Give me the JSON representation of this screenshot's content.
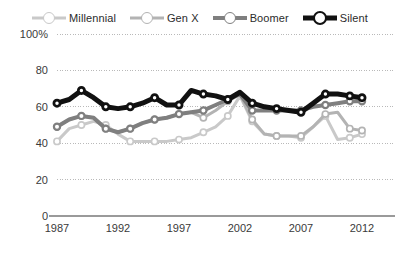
{
  "legend": {
    "position": "top-center",
    "items": [
      {
        "label": "Millennial",
        "color": "#c9c9c9",
        "line_width": 3,
        "marker": "open-circle",
        "marker_size": 5
      },
      {
        "label": "Gen X",
        "color": "#b3b3b3",
        "line_width": 3,
        "marker": "open-circle",
        "marker_size": 5
      },
      {
        "label": "Boomer",
        "color": "#7f7f7f",
        "line_width": 4,
        "marker": "open-circle",
        "marker_size": 5
      },
      {
        "label": "Silent",
        "color": "#111111",
        "line_width": 5,
        "marker": "open-circle",
        "marker_size": 5
      }
    ]
  },
  "axes": {
    "y_ticks": [
      "0",
      "20",
      "40",
      "60",
      "80",
      "100%"
    ],
    "y_values": [
      0,
      20,
      40,
      60,
      80,
      100
    ],
    "x_ticks": [
      "1987",
      "1992",
      "1997",
      "2002",
      "2007",
      "2012"
    ],
    "x_values": [
      1987,
      1992,
      1997,
      2002,
      2007,
      2012
    ],
    "grid": "horizontal-dotted"
  },
  "chart_data": {
    "type": "line",
    "title": "",
    "xlabel": "",
    "ylabel": "",
    "xlim": [
      1987,
      2012
    ],
    "ylim": [
      0,
      100
    ],
    "grid": true,
    "legend_position": "top-center",
    "x": [
      1987,
      1988,
      1989,
      1990,
      1991,
      1992,
      1993,
      1994,
      1995,
      1996,
      1997,
      1998,
      1999,
      2000,
      2001,
      2002,
      2003,
      2004,
      2005,
      2006,
      2007,
      2008,
      2009,
      2010,
      2011,
      2012
    ],
    "series": [
      {
        "name": "Millennial",
        "color": "#c9c9c9",
        "values": [
          41,
          48,
          50,
          52,
          50,
          45,
          41,
          41,
          41,
          41,
          42,
          43,
          46,
          49,
          55,
          66,
          52,
          45,
          44,
          44,
          43,
          49,
          55,
          42,
          43,
          45
        ]
      },
      {
        "name": "Gen X",
        "color": "#b3b3b3",
        "values": [
          49,
          53,
          55,
          54,
          48,
          46,
          48,
          51,
          53,
          54,
          56,
          57,
          54,
          58,
          63,
          67,
          53,
          45,
          44,
          44,
          44,
          49,
          56,
          57,
          48,
          47
        ]
      },
      {
        "name": "Boomer",
        "color": "#7f7f7f",
        "values": [
          49,
          53,
          55,
          54,
          48,
          46,
          48,
          51,
          53,
          54,
          56,
          57,
          58,
          61,
          64,
          67,
          58,
          58,
          58,
          58,
          58,
          60,
          61,
          62,
          63,
          63
        ]
      },
      {
        "name": "Silent",
        "color": "#111111",
        "values": [
          62,
          64,
          69,
          65,
          60,
          59,
          60,
          62,
          65,
          61,
          61,
          69,
          67,
          66,
          64,
          68,
          62,
          60,
          59,
          58,
          57,
          62,
          67,
          67,
          66,
          65
        ]
      }
    ]
  }
}
